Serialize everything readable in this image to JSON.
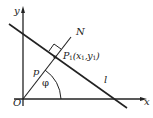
{
  "diagram": {
    "labels": {
      "y_axis": "y",
      "x_axis": "x",
      "origin": "O",
      "normal": "N",
      "foot_point": "P",
      "foot_point_sub": "1",
      "foot_coords_open": "(x",
      "foot_coords_sub1": "1",
      "foot_coords_mid": ",y",
      "foot_coords_sub2": "1",
      "foot_coords_close": ")",
      "distance": "p",
      "angle": "φ",
      "line": "l"
    },
    "colors": {
      "stroke": "#222222",
      "background": "#ffffff"
    }
  }
}
